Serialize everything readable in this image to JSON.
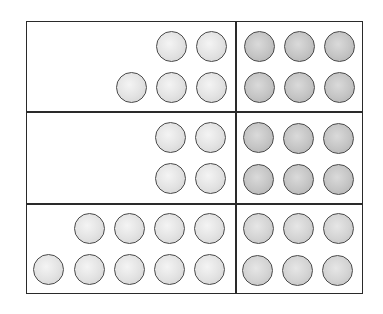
{
  "diagram": {
    "title": "",
    "colors": {
      "border": "#2a2a2a",
      "counter_outline": "#4a4a4a",
      "counter_light": "#e2e2e2",
      "counter_dark": "#c4c4c4"
    },
    "rows": [
      {
        "left": {
          "count": 5,
          "arrangement": "2 on top, 3 on bottom, right-aligned",
          "shade": "light"
        },
        "right": {
          "count": 6,
          "arrangement": "2 rows of 3",
          "shade": "dark"
        }
      },
      {
        "left": {
          "count": 4,
          "arrangement": "2 rows of 2, right-aligned",
          "shade": "light"
        },
        "right": {
          "count": 6,
          "arrangement": "2 rows of 3",
          "shade": "dark"
        }
      },
      {
        "left": {
          "count": 9,
          "arrangement": "4 on top, 5 on bottom, right-aligned",
          "shade": "light"
        },
        "right": {
          "count": 6,
          "arrangement": "2 rows of 3",
          "shade": "medium"
        }
      }
    ]
  }
}
